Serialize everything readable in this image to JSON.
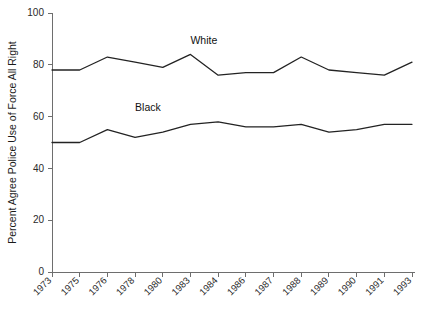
{
  "chart_data": {
    "type": "line",
    "title": "",
    "xlabel": "",
    "ylabel": "Percent Agree Police Use of Force All Right",
    "categories": [
      "1973",
      "1975",
      "1976",
      "1978",
      "1980",
      "1983",
      "1984",
      "1986",
      "1987",
      "1988",
      "1989",
      "1990",
      "1991",
      "1993"
    ],
    "ylim": [
      0,
      100
    ],
    "yticks": [
      0,
      20,
      40,
      60,
      80,
      100
    ],
    "ytick_labels": [
      "0",
      "20",
      "40",
      "60",
      "80",
      "100"
    ],
    "grid": false,
    "legend_position": "inline-annotation",
    "series": [
      {
        "name": "White",
        "color": "#232323",
        "label_anchor_year": "1983",
        "values": [
          78,
          78,
          83,
          81,
          79,
          84,
          76,
          77,
          77,
          83,
          78,
          77,
          76,
          81
        ]
      },
      {
        "name": "Black",
        "color": "#232323",
        "label_anchor_year": "1978",
        "values": [
          50,
          50,
          55,
          52,
          54,
          57,
          58,
          56,
          56,
          57,
          54,
          55,
          57,
          57
        ]
      }
    ],
    "annotations": [
      {
        "text": "White",
        "x_year": "1983",
        "y_value": 88
      },
      {
        "text": "Black",
        "x_year": "1978",
        "y_value": 62
      }
    ]
  },
  "axis": {
    "y_title": "Percent Agree Police Use of Force All Right",
    "x_title": ""
  }
}
